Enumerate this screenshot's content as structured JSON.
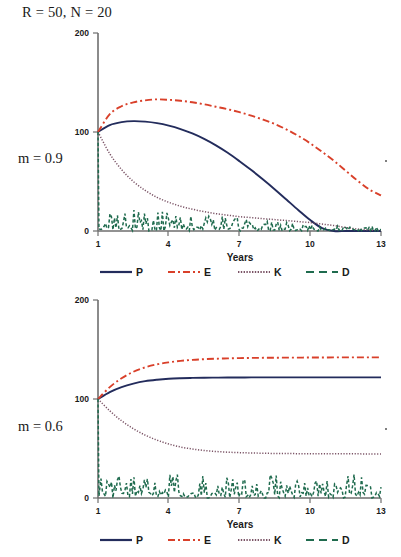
{
  "figure": {
    "title": "R = 50, N = 20",
    "panels": [
      {
        "label": "m = 0.9",
        "xlabel": "Years",
        "xticks": [
          "1",
          "4",
          "7",
          "10",
          "13"
        ],
        "yticks": [
          "0",
          "100",
          "200"
        ],
        "legend": [
          "P",
          "E",
          "K",
          "D"
        ]
      },
      {
        "label": "m = 0.6",
        "xlabel": "Years",
        "xticks": [
          "1",
          "4",
          "7",
          "10",
          "13"
        ],
        "yticks": [
          "0",
          "100",
          "200"
        ],
        "legend": [
          "P",
          "E",
          "K",
          "D"
        ]
      }
    ]
  },
  "colors": {
    "P": "#232c5c",
    "E": "#d9402a",
    "K": "#7b5466",
    "D": "#1f6b4e",
    "axis": "#6e6e6e",
    "text": "#1a1a1a"
  },
  "chart_data": [
    {
      "type": "line",
      "title": "R = 50, N = 20",
      "panel_label": "m = 0.9",
      "xlabel": "Years",
      "ylabel": "",
      "xlim": [
        1,
        13
      ],
      "ylim": [
        0,
        200
      ],
      "xticks": [
        1,
        4,
        7,
        10,
        13
      ],
      "yticks": [
        0,
        100,
        200
      ],
      "grid": false,
      "legend_position": "bottom",
      "x": [
        1,
        1.5,
        2,
        2.5,
        3,
        3.5,
        4,
        4.5,
        5,
        5.5,
        6,
        6.5,
        7,
        7.5,
        8,
        8.5,
        9,
        9.5,
        10,
        10.5,
        11,
        11.5,
        12,
        12.5,
        13
      ],
      "series": [
        {
          "name": "P",
          "style": "solid",
          "color": "#232c5c",
          "values": [
            100,
            107,
            110,
            111,
            110.5,
            109,
            106.5,
            103,
            98.5,
            93,
            86.5,
            79,
            70.5,
            61.5,
            52,
            42,
            31.5,
            21,
            11,
            3,
            0,
            0,
            0,
            0,
            0
          ]
        },
        {
          "name": "E",
          "style": "dashdot",
          "color": "#d9402a",
          "values": [
            100,
            118,
            126,
            130,
            132,
            133,
            132.5,
            131.5,
            130,
            128,
            125.5,
            123,
            120,
            116.5,
            112.5,
            108,
            102.5,
            96,
            88.5,
            80,
            71,
            61,
            51,
            42,
            36
          ]
        },
        {
          "name": "K",
          "style": "dotted",
          "color": "#7b5466",
          "values": [
            100,
            78,
            62,
            50,
            41,
            34,
            29,
            25,
            22,
            19.5,
            17.5,
            16,
            14.5,
            13.5,
            12.5,
            11.5,
            10.5,
            9.5,
            8.5,
            7,
            5.5,
            3.5,
            2,
            1,
            0.5
          ]
        },
        {
          "name": "D",
          "style": "dashed",
          "color": "#1f6b4e",
          "description": "high-frequency noisy oscillation near zero, initial spike from 100 down to ~0 at year 1, then jitter amplitude ~0-20 decaying slowly across the span",
          "values": [
            100,
            18,
            12,
            9,
            11,
            7,
            10,
            6,
            9,
            5,
            8,
            5,
            7,
            4,
            6,
            4,
            5,
            3,
            4,
            3,
            3,
            2,
            2,
            1,
            1
          ]
        }
      ]
    },
    {
      "type": "line",
      "title": "",
      "panel_label": "m = 0.6",
      "xlabel": "Years",
      "ylabel": "",
      "xlim": [
        1,
        13
      ],
      "ylim": [
        0,
        200
      ],
      "xticks": [
        1,
        4,
        7,
        10,
        13
      ],
      "yticks": [
        0,
        100,
        200
      ],
      "grid": false,
      "legend_position": "bottom",
      "x": [
        1,
        1.5,
        2,
        2.5,
        3,
        3.5,
        4,
        4.5,
        5,
        5.5,
        6,
        6.5,
        7,
        7.5,
        8,
        8.5,
        9,
        9.5,
        10,
        10.5,
        11,
        11.5,
        12,
        12.5,
        13
      ],
      "series": [
        {
          "name": "P",
          "style": "solid",
          "color": "#232c5c",
          "values": [
            100,
            107,
            112,
            115.5,
            118,
            119.5,
            120.5,
            121,
            121.3,
            121.5,
            121.6,
            121.7,
            121.7,
            121.8,
            121.8,
            121.8,
            121.8,
            121.8,
            121.8,
            121.8,
            121.8,
            121.8,
            121.8,
            121.8,
            121.8
          ]
        },
        {
          "name": "E",
          "style": "dashdot",
          "color": "#d9402a",
          "values": [
            100,
            112,
            121,
            127.5,
            132,
            135,
            137,
            138.5,
            139.5,
            140.2,
            140.7,
            141,
            141.3,
            141.5,
            141.6,
            141.7,
            141.8,
            141.8,
            141.9,
            141.9,
            142,
            142,
            142,
            142,
            142
          ]
        },
        {
          "name": "K",
          "style": "dotted",
          "color": "#7b5466",
          "values": [
            100,
            88,
            78,
            70,
            63.5,
            58.5,
            54.5,
            51.5,
            49.5,
            48,
            47,
            46.3,
            45.8,
            45.5,
            45.2,
            45,
            44.9,
            44.8,
            44.7,
            44.7,
            44.6,
            44.6,
            44.6,
            44.5,
            44.5
          ]
        },
        {
          "name": "D",
          "style": "dashed",
          "color": "#1f6b4e",
          "description": "high-frequency noisy oscillation near zero, initial spike from 100 down to ~0 at year 1, then persistent jitter amplitude ~0-22 sustained across the full span",
          "values": [
            100,
            20,
            14,
            18,
            11,
            19,
            12,
            17,
            13,
            18,
            11,
            16,
            12,
            19,
            13,
            17,
            11,
            18,
            12,
            16,
            13,
            19,
            12,
            17,
            14
          ]
        }
      ]
    }
  ]
}
